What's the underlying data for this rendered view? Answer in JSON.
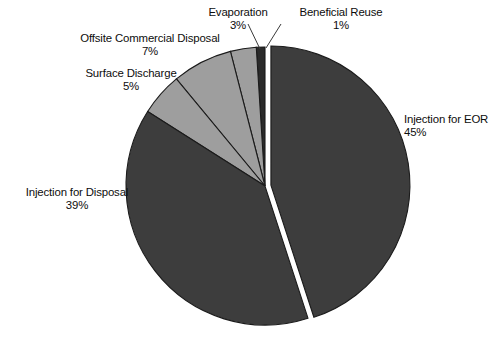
{
  "chart_data": {
    "type": "pie",
    "title": "",
    "subtitle": "",
    "xlabel": "",
    "ylabel": "",
    "legend_position": "none",
    "grid": false,
    "units": "percent",
    "total": 100,
    "start_angle_deg": 0,
    "direction": "counterclockwise",
    "categories": [
      "Injection for EOR",
      "Beneficial Reuse",
      "Evaporation",
      "Offsite Commercial Disposal",
      "Surface Discharge",
      "Injection for Disposal"
    ],
    "values": [
      45,
      1,
      3,
      7,
      5,
      39
    ],
    "slices": [
      {
        "label": "Injection for EOR",
        "value": 45,
        "value_text": "45%",
        "color": "#3d3d3d",
        "exploded": true
      },
      {
        "label": "Beneficial Reuse",
        "value": 1,
        "value_text": "1%",
        "color": "#2a2a2a",
        "exploded": false
      },
      {
        "label": "Evaporation",
        "value": 3,
        "value_text": "3%",
        "color": "#9e9e9e",
        "exploded": false
      },
      {
        "label": "Offsite Commercial Disposal",
        "value": 7,
        "value_text": "7%",
        "color": "#9e9e9e",
        "exploded": false
      },
      {
        "label": "Surface Discharge",
        "value": 5,
        "value_text": "5%",
        "color": "#9e9e9e",
        "exploded": false
      },
      {
        "label": "Injection for Disposal",
        "value": 39,
        "value_text": "39%",
        "color": "#3d3d3d",
        "exploded": false
      }
    ]
  },
  "labels": {
    "beneficial_reuse": {
      "name": "Beneficial Reuse",
      "value": "1%"
    },
    "evaporation": {
      "name": "Evaporation",
      "value": "3%"
    },
    "offsite_commercial_disposal": {
      "name": "Offsite Commercial Disposal",
      "value": "7%"
    },
    "surface_discharge": {
      "name": "Surface Discharge",
      "value": "5%"
    },
    "injection_for_disposal": {
      "name": "Injection for Disposal",
      "value": "39%"
    },
    "injection_for_eor": {
      "name": "Injection for EOR",
      "value": "45%"
    }
  },
  "colors": {
    "dark_slice": "#3d3d3d",
    "darkest_slice": "#2a2a2a",
    "light_slice": "#9e9e9e",
    "outline": "#1b1b1b",
    "background": "#ffffff",
    "text": "#0d0d0d"
  },
  "geometry": {
    "center_x": 265,
    "center_y": 186,
    "radius": 139,
    "explode_offset": 6
  }
}
